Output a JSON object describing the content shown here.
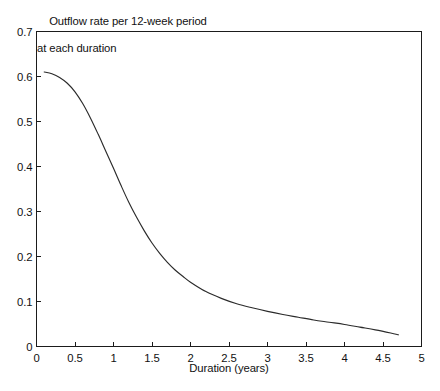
{
  "chart_data": {
    "type": "line",
    "title": "Outflow rate per 12-week period at each duration",
    "title_line1": "Outflow rate per 12-week period",
    "title_line2": "at each duration",
    "xlabel": "Duration (years)",
    "ylabel": "",
    "xlim": [
      0,
      5
    ],
    "ylim": [
      0,
      0.7
    ],
    "grid": false,
    "legend": false,
    "legend_position": "none",
    "line_color": "#2b2b2b",
    "background_color": "#ffffff",
    "axis_color": "#1b1b1b",
    "xticks": [
      0,
      0.5,
      1,
      1.5,
      2,
      2.5,
      3,
      3.5,
      4,
      4.5,
      5
    ],
    "xtick_labels": [
      "0",
      "0.5",
      "1",
      "1.5",
      "2",
      "2.5",
      "3",
      "3.5",
      "4",
      "4.5",
      "5"
    ],
    "yticks": [
      0,
      0.1,
      0.2,
      0.3,
      0.4,
      0.5,
      0.6,
      0.7
    ],
    "ytick_labels": [
      "0",
      "0.1",
      "0.2",
      "0.3",
      "0.4",
      "0.5",
      "0.6",
      "0.7"
    ],
    "series": [
      {
        "name": "Outflow rate",
        "x": [
          0.1,
          0.2,
          0.3,
          0.4,
          0.5,
          0.6,
          0.7,
          0.8,
          0.9,
          1.0,
          1.1,
          1.2,
          1.3,
          1.4,
          1.5,
          1.6,
          1.7,
          1.8,
          1.9,
          2.0,
          2.2,
          2.4,
          2.6,
          2.8,
          3.0,
          3.2,
          3.4,
          3.6,
          3.8,
          4.0,
          4.2,
          4.4,
          4.6,
          4.7
        ],
        "y": [
          0.61,
          0.606,
          0.598,
          0.585,
          0.566,
          0.54,
          0.508,
          0.472,
          0.434,
          0.396,
          0.357,
          0.32,
          0.287,
          0.257,
          0.23,
          0.207,
          0.187,
          0.17,
          0.156,
          0.143,
          0.122,
          0.107,
          0.095,
          0.086,
          0.078,
          0.071,
          0.065,
          0.059,
          0.054,
          0.049,
          0.043,
          0.037,
          0.03,
          0.026
        ]
      }
    ],
    "caption_partial": ""
  }
}
